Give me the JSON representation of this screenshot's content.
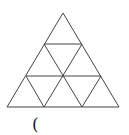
{
  "header": {
    "cropped_text": ""
  },
  "figure": {
    "name": "subdivided-triangle",
    "stroke": "#444444",
    "rows": 3,
    "outer": {
      "apex": [
        63,
        13
      ],
      "bottom_left": [
        7,
        107
      ],
      "bottom_right": [
        119,
        107
      ]
    },
    "horizontal_lines": [
      {
        "y": 44,
        "x1": 44,
        "x2": 82
      },
      {
        "y": 76,
        "x1": 26,
        "x2": 101
      }
    ],
    "diagonals": [
      {
        "x1": 44,
        "y1": 44,
        "x2": 82,
        "y2": 107
      },
      {
        "x1": 82,
        "y1": 44,
        "x2": 44,
        "y2": 107
      },
      {
        "x1": 26,
        "y1": 76,
        "x2": 44,
        "y2": 107
      },
      {
        "x1": 101,
        "y1": 76,
        "x2": 82,
        "y2": 107
      }
    ]
  },
  "answer_blank": {
    "open_paren": "("
  }
}
